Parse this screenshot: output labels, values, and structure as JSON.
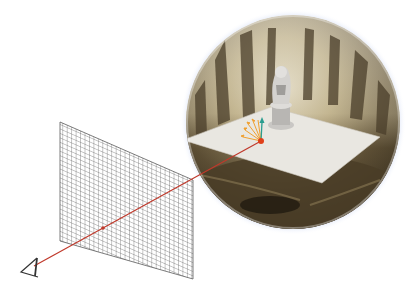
{
  "figure": {
    "colors": {
      "background": "#ffffff",
      "grid_line": "#5a5a5a",
      "ray": "#c0392b",
      "hit_point": "#e0401a",
      "sphere_rim_glow": "#b8c8f0",
      "plane": "#e9e7e1",
      "env_dark": "#3b3222",
      "env_mid": "#7a6a48",
      "env_light": "#d9d2bd",
      "normal_arrow": "#2a9d8f",
      "sample_arrows": "#f0a030",
      "camera": "#333333"
    },
    "elements": {
      "camera": {
        "label": "camera-eye",
        "x": 28,
        "y": 268
      },
      "image_plane": {
        "rows": 24,
        "cols": 30
      },
      "ray": {
        "from": [
          34,
          266
        ],
        "to": [
          261,
          141
        ]
      },
      "sphere": {
        "cx": 293,
        "cy": 122,
        "r": 108
      },
      "hit_point": {
        "x": 261,
        "y": 141
      },
      "statue": {
        "x": 282,
        "y": 95
      }
    }
  }
}
